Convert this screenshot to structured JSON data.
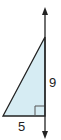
{
  "diagram": {
    "type": "right-triangle",
    "labels": {
      "vertical_leg": "9",
      "horizontal_leg": "5"
    },
    "colors": {
      "fill": "#d6ecf3",
      "stroke": "#222222",
      "axis": "#222222",
      "right_angle_mark": "#555555"
    },
    "vertices": {
      "apex": [
        45,
        37
      ],
      "bottom_left": [
        3,
        116
      ],
      "right_angle": [
        45,
        116
      ]
    },
    "axis": {
      "x": 45,
      "y_top": 8,
      "y_bottom": 138,
      "arrows": "both"
    }
  }
}
